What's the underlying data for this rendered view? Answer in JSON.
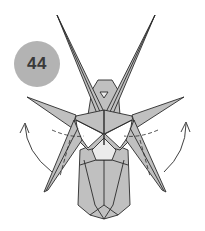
{
  "diagram": {
    "type": "origami-folding-step",
    "step_number": "44",
    "colors": {
      "paper_fill": "#c0c0c0",
      "paper_light": "#ebebeb",
      "paper_white": "#ffffff",
      "edge": "#2a2a2a",
      "badge": "#b3b3b3",
      "badge_text": "#3a3a3a"
    },
    "annotations": [
      {
        "kind": "curved-arrow",
        "side": "left",
        "direction": "up-outward"
      },
      {
        "kind": "curved-arrow",
        "side": "right",
        "direction": "up-outward"
      },
      {
        "kind": "valley-fold-line",
        "side": "left"
      },
      {
        "kind": "valley-fold-line",
        "side": "right"
      }
    ]
  }
}
